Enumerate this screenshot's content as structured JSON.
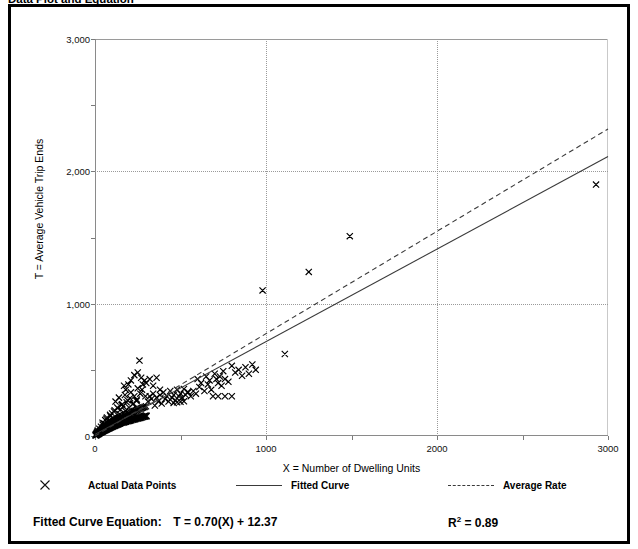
{
  "title": "Data Plot and Equation",
  "axes": {
    "x_title": "X = Number of Dwelling Units",
    "y_title": "T = Average Vehicle Trip Ends",
    "x_ticklabels": [
      "0",
      "1000",
      "2000",
      "3000"
    ],
    "y_ticklabels": [
      "0",
      "1,000",
      "2,000",
      "3,000"
    ]
  },
  "legend": {
    "data_points_label": "Actual Data Points",
    "fitted_curve_label": "Fitted Curve",
    "average_rate_label": "Average Rate",
    "marker_icon": "x-marker-icon",
    "fitted_icon": "solid-line-icon",
    "average_icon": "dashed-line-icon"
  },
  "equation": {
    "label": "Fitted Curve Equation:",
    "formula": "T = 0.70(X) + 12.37",
    "r2_prefix": "R",
    "r2_exponent": "2",
    "r2_value": "= 0.89"
  },
  "chart_data": {
    "type": "scatter",
    "title": "Data Plot and Equation",
    "xlabel": "X = Number of Dwelling Units",
    "ylabel": "T = Average Vehicle Trip Ends",
    "xlim": [
      0,
      3000
    ],
    "ylim": [
      0,
      3000
    ],
    "xticks": [
      0,
      1000,
      2000,
      3000
    ],
    "yticks": [
      0,
      1000,
      2000,
      3000
    ],
    "xminorticks": [
      500,
      1500,
      2500
    ],
    "yminorticks": [
      500,
      1500,
      2500
    ],
    "grid": true,
    "gridlines_x": [
      1000,
      2000
    ],
    "gridlines_y": [
      1000,
      2000
    ],
    "legend_position": "below-plot",
    "series": [
      {
        "name": "Actual Data Points",
        "type": "scatter",
        "marker": "x",
        "color": "#000000",
        "points": [
          [
            6,
            4
          ],
          [
            8,
            9
          ],
          [
            10,
            7
          ],
          [
            11,
            14
          ],
          [
            13,
            10
          ],
          [
            14,
            18
          ],
          [
            15,
            12
          ],
          [
            16,
            22
          ],
          [
            17,
            15
          ],
          [
            18,
            25
          ],
          [
            19,
            13
          ],
          [
            20,
            20
          ],
          [
            21,
            28
          ],
          [
            22,
            17
          ],
          [
            23,
            30
          ],
          [
            24,
            24
          ],
          [
            25,
            19
          ],
          [
            26,
            33
          ],
          [
            27,
            26
          ],
          [
            28,
            22
          ],
          [
            29,
            36
          ],
          [
            30,
            28
          ],
          [
            31,
            24
          ],
          [
            32,
            40
          ],
          [
            33,
            31
          ],
          [
            34,
            26
          ],
          [
            35,
            44
          ],
          [
            36,
            33
          ],
          [
            37,
            29
          ],
          [
            38,
            47
          ],
          [
            39,
            35
          ],
          [
            40,
            31
          ],
          [
            41,
            50
          ],
          [
            42,
            37
          ],
          [
            43,
            33
          ],
          [
            44,
            54
          ],
          [
            45,
            40
          ],
          [
            46,
            35
          ],
          [
            47,
            57
          ],
          [
            48,
            42
          ],
          [
            49,
            38
          ],
          [
            50,
            60
          ],
          [
            52,
            44
          ],
          [
            54,
            40
          ],
          [
            55,
            64
          ],
          [
            56,
            47
          ],
          [
            58,
            43
          ],
          [
            60,
            68
          ],
          [
            61,
            50
          ],
          [
            62,
            46
          ],
          [
            64,
            72
          ],
          [
            65,
            53
          ],
          [
            66,
            48
          ],
          [
            68,
            76
          ],
          [
            70,
            56
          ],
          [
            71,
            51
          ],
          [
            72,
            80
          ],
          [
            74,
            58
          ],
          [
            75,
            54
          ],
          [
            76,
            84
          ],
          [
            78,
            61
          ],
          [
            80,
            57
          ],
          [
            81,
            88
          ],
          [
            82,
            64
          ],
          [
            84,
            59
          ],
          [
            85,
            92
          ],
          [
            86,
            67
          ],
          [
            88,
            62
          ],
          [
            90,
            96
          ],
          [
            91,
            69
          ],
          [
            92,
            65
          ],
          [
            94,
            100
          ],
          [
            95,
            72
          ],
          [
            96,
            67
          ],
          [
            98,
            104
          ],
          [
            100,
            75
          ],
          [
            102,
            70
          ],
          [
            104,
            108
          ],
          [
            105,
            78
          ],
          [
            106,
            73
          ],
          [
            108,
            112
          ],
          [
            110,
            80
          ],
          [
            112,
            76
          ],
          [
            114,
            116
          ],
          [
            115,
            83
          ],
          [
            116,
            78
          ],
          [
            118,
            120
          ],
          [
            120,
            86
          ],
          [
            122,
            81
          ],
          [
            124,
            124
          ],
          [
            125,
            88
          ],
          [
            126,
            84
          ],
          [
            128,
            128
          ],
          [
            130,
            91
          ],
          [
            132,
            87
          ],
          [
            134,
            132
          ],
          [
            135,
            94
          ],
          [
            136,
            89
          ],
          [
            138,
            136
          ],
          [
            140,
            97
          ],
          [
            142,
            92
          ],
          [
            144,
            140
          ],
          [
            145,
            100
          ],
          [
            146,
            95
          ],
          [
            148,
            144
          ],
          [
            150,
            102
          ],
          [
            152,
            98
          ],
          [
            155,
            148
          ],
          [
            158,
            105
          ],
          [
            160,
            100
          ],
          [
            162,
            152
          ],
          [
            165,
            108
          ],
          [
            168,
            103
          ],
          [
            170,
            156
          ],
          [
            172,
            110
          ],
          [
            175,
            106
          ],
          [
            178,
            160
          ],
          [
            180,
            113
          ],
          [
            182,
            108
          ],
          [
            185,
            164
          ],
          [
            188,
            116
          ],
          [
            190,
            111
          ],
          [
            192,
            168
          ],
          [
            195,
            118
          ],
          [
            198,
            114
          ],
          [
            200,
            172
          ],
          [
            202,
            121
          ],
          [
            205,
            116
          ],
          [
            208,
            176
          ],
          [
            210,
            124
          ],
          [
            212,
            119
          ],
          [
            215,
            180
          ],
          [
            218,
            126
          ],
          [
            220,
            122
          ],
          [
            222,
            184
          ],
          [
            225,
            129
          ],
          [
            228,
            124
          ],
          [
            230,
            188
          ],
          [
            232,
            132
          ],
          [
            235,
            127
          ],
          [
            238,
            192
          ],
          [
            240,
            134
          ],
          [
            242,
            130
          ],
          [
            245,
            196
          ],
          [
            248,
            137
          ],
          [
            250,
            132
          ],
          [
            252,
            200
          ],
          [
            255,
            140
          ],
          [
            258,
            135
          ],
          [
            260,
            204
          ],
          [
            262,
            142
          ],
          [
            265,
            137
          ],
          [
            268,
            208
          ],
          [
            270,
            145
          ],
          [
            272,
            140
          ],
          [
            275,
            212
          ],
          [
            278,
            148
          ],
          [
            280,
            143
          ],
          [
            282,
            216
          ],
          [
            285,
            150
          ],
          [
            288,
            145
          ],
          [
            290,
            220
          ],
          [
            292,
            153
          ],
          [
            295,
            148
          ],
          [
            298,
            224
          ],
          [
            300,
            155
          ],
          [
            302,
            150
          ],
          [
            120,
            260
          ],
          [
            140,
            290
          ],
          [
            160,
            240
          ],
          [
            175,
            310
          ],
          [
            190,
            270
          ],
          [
            210,
            330
          ],
          [
            230,
            300
          ],
          [
            250,
            360
          ],
          [
            265,
            320
          ],
          [
            280,
            390
          ],
          [
            150,
            200
          ],
          [
            165,
            225
          ],
          [
            185,
            255
          ],
          [
            205,
            285
          ],
          [
            225,
            245
          ],
          [
            245,
            275
          ],
          [
            100,
            170
          ],
          [
            115,
            195
          ],
          [
            130,
            215
          ],
          [
            145,
            165
          ],
          [
            260,
            570
          ],
          [
            275,
            350
          ],
          [
            290,
            420
          ],
          [
            295,
            300
          ],
          [
            310,
            260
          ],
          [
            320,
            300
          ],
          [
            330,
            280
          ],
          [
            340,
            320
          ],
          [
            350,
            230
          ],
          [
            360,
            290
          ],
          [
            370,
            260
          ],
          [
            380,
            310
          ],
          [
            390,
            245
          ],
          [
            400,
            330
          ],
          [
            410,
            280
          ],
          [
            420,
            300
          ],
          [
            430,
            260
          ],
          [
            440,
            340
          ],
          [
            450,
            290
          ],
          [
            460,
            310
          ],
          [
            470,
            270
          ],
          [
            480,
            350
          ],
          [
            490,
            300
          ],
          [
            500,
            320
          ],
          [
            510,
            290
          ],
          [
            520,
            355
          ],
          [
            530,
            310
          ],
          [
            540,
            330
          ],
          [
            460,
            250
          ],
          [
            480,
            255
          ],
          [
            500,
            258
          ],
          [
            520,
            262
          ],
          [
            545,
            330
          ],
          [
            560,
            300
          ],
          [
            575,
            340
          ],
          [
            590,
            320
          ],
          [
            600,
            430
          ],
          [
            610,
            370
          ],
          [
            620,
            400
          ],
          [
            640,
            340
          ],
          [
            650,
            450
          ],
          [
            660,
            390
          ],
          [
            670,
            420
          ],
          [
            680,
            350
          ],
          [
            700,
            470
          ],
          [
            710,
            430
          ],
          [
            720,
            400
          ],
          [
            730,
            450
          ],
          [
            740,
            380
          ],
          [
            750,
            490
          ],
          [
            760,
            430
          ],
          [
            780,
            410
          ],
          [
            800,
            530
          ],
          [
            820,
            480
          ],
          [
            840,
            500
          ],
          [
            860,
            455
          ],
          [
            880,
            520
          ],
          [
            900,
            470
          ],
          [
            920,
            540
          ],
          [
            940,
            500
          ],
          [
            690,
            300
          ],
          [
            720,
            300
          ],
          [
            760,
            300
          ],
          [
            800,
            300
          ],
          [
            300,
            400
          ],
          [
            320,
            430
          ],
          [
            340,
            380
          ],
          [
            360,
            440
          ],
          [
            380,
            350
          ],
          [
            250,
            480
          ],
          [
            270,
            440
          ],
          [
            230,
            460
          ],
          [
            210,
            420
          ],
          [
            195,
            390
          ],
          [
            180,
            350
          ],
          [
            170,
            380
          ],
          [
            980,
            1100
          ],
          [
            1110,
            620
          ],
          [
            1250,
            1240
          ],
          [
            1490,
            1510
          ],
          [
            2930,
            1900
          ],
          [
            60,
            120
          ],
          [
            70,
            140
          ],
          [
            80,
            110
          ],
          [
            90,
            150
          ],
          [
            55,
            95
          ],
          [
            45,
            85
          ],
          [
            35,
            70
          ],
          [
            25,
            55
          ],
          [
            15,
            40
          ],
          [
            12,
            30
          ],
          [
            9,
            20
          ],
          [
            7,
            15
          ],
          [
            5,
            8
          ],
          [
            4,
            12
          ],
          [
            3,
            6
          ],
          [
            2,
            5
          ],
          [
            44,
            100
          ],
          [
            66,
            130
          ],
          [
            88,
            160
          ],
          [
            111,
            185
          ],
          [
            133,
            210
          ],
          [
            155,
            235
          ],
          [
            177,
            190
          ],
          [
            199,
            215
          ],
          [
            221,
            240
          ],
          [
            243,
            265
          ]
        ]
      },
      {
        "name": "Fitted Curve",
        "type": "line",
        "style": "solid",
        "color": "#3a3a3a",
        "equation": "T = 0.70(X) + 12.37",
        "slope": 0.7,
        "intercept": 12.37,
        "r_squared": 0.89,
        "endpoints": [
          [
            0,
            12.37
          ],
          [
            3000,
            2112.37
          ]
        ]
      },
      {
        "name": "Average Rate",
        "type": "line",
        "style": "dashed",
        "color": "#3a3a3a",
        "slope": 0.7733,
        "intercept": 0,
        "endpoints": [
          [
            0,
            0
          ],
          [
            3000,
            2320
          ]
        ]
      }
    ]
  }
}
